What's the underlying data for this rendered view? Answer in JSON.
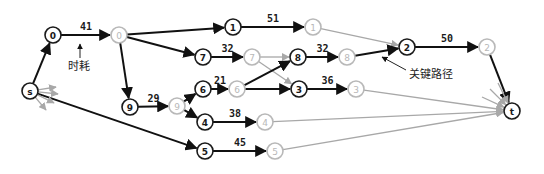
{
  "diagram": {
    "type": "critical-path-network",
    "annotations": {
      "time_cost": "时耗",
      "critical_path": "关键路径"
    },
    "nodes": [
      {
        "id": "s",
        "label": "s",
        "x": 30,
        "y": 91,
        "style": "dark"
      },
      {
        "id": "0a",
        "label": "0",
        "x": 53,
        "y": 35,
        "style": "dark"
      },
      {
        "id": "0b",
        "label": "0",
        "x": 119,
        "y": 35,
        "style": "gray"
      },
      {
        "id": "1a",
        "label": "1",
        "x": 233,
        "y": 27,
        "style": "dark"
      },
      {
        "id": "1b",
        "label": "1",
        "x": 313,
        "y": 27,
        "style": "gray"
      },
      {
        "id": "2a",
        "label": "2",
        "x": 407,
        "y": 47,
        "style": "dark"
      },
      {
        "id": "2b",
        "label": "2",
        "x": 487,
        "y": 47,
        "style": "gray"
      },
      {
        "id": "7a",
        "label": "7",
        "x": 203,
        "y": 57,
        "style": "dark"
      },
      {
        "id": "7b",
        "label": "7",
        "x": 252,
        "y": 57,
        "style": "gray"
      },
      {
        "id": "8a",
        "label": "8",
        "x": 298,
        "y": 57,
        "style": "dark"
      },
      {
        "id": "8b",
        "label": "8",
        "x": 347,
        "y": 57,
        "style": "gray"
      },
      {
        "id": "9a",
        "label": "9",
        "x": 130,
        "y": 107,
        "style": "dark"
      },
      {
        "id": "9b",
        "label": "9",
        "x": 177,
        "y": 106,
        "style": "gray"
      },
      {
        "id": "6a",
        "label": "6",
        "x": 203,
        "y": 89,
        "style": "dark"
      },
      {
        "id": "6b",
        "label": "6",
        "x": 237,
        "y": 89,
        "style": "gray"
      },
      {
        "id": "3a",
        "label": "3",
        "x": 299,
        "y": 89,
        "style": "dark"
      },
      {
        "id": "3b",
        "label": "3",
        "x": 356,
        "y": 89,
        "style": "gray"
      },
      {
        "id": "4a",
        "label": "4",
        "x": 205,
        "y": 122,
        "style": "dark"
      },
      {
        "id": "4b",
        "label": "4",
        "x": 265,
        "y": 122,
        "style": "gray"
      },
      {
        "id": "5a",
        "label": "5",
        "x": 205,
        "y": 151,
        "style": "dark"
      },
      {
        "id": "5b",
        "label": "5",
        "x": 275,
        "y": 151,
        "style": "gray"
      },
      {
        "id": "t",
        "label": "t",
        "x": 512,
        "y": 111,
        "style": "dark"
      }
    ],
    "edges": [
      {
        "from": "s",
        "to": "0a",
        "style": "dark"
      },
      {
        "from": "0a",
        "to": "0b",
        "style": "dark",
        "weight": "41"
      },
      {
        "from": "0b",
        "to": "1a",
        "style": "dark"
      },
      {
        "from": "0b",
        "to": "7a",
        "style": "dark"
      },
      {
        "from": "0b",
        "to": "9a",
        "style": "dark"
      },
      {
        "from": "1a",
        "to": "1b",
        "style": "dark",
        "weight": "51"
      },
      {
        "from": "1b",
        "to": "2a",
        "style": "gray"
      },
      {
        "from": "7a",
        "to": "7b",
        "style": "dark",
        "weight": "32"
      },
      {
        "from": "7b",
        "to": "8a",
        "style": "gray"
      },
      {
        "from": "7b",
        "to": "3a",
        "style": "gray"
      },
      {
        "from": "8a",
        "to": "8b",
        "style": "dark",
        "weight": "32"
      },
      {
        "from": "8b",
        "to": "2a",
        "style": "dark"
      },
      {
        "from": "2a",
        "to": "2b",
        "style": "dark",
        "weight": "50"
      },
      {
        "from": "2b",
        "to": "t",
        "style": "dark"
      },
      {
        "from": "9a",
        "to": "9b",
        "style": "dark",
        "weight": "29"
      },
      {
        "from": "9b",
        "to": "6a",
        "style": "dark"
      },
      {
        "from": "9b",
        "to": "4a",
        "style": "dark"
      },
      {
        "from": "6a",
        "to": "6b",
        "style": "dark",
        "weight": "21"
      },
      {
        "from": "6b",
        "to": "8a",
        "style": "dark"
      },
      {
        "from": "6b",
        "to": "3a",
        "style": "dark"
      },
      {
        "from": "3a",
        "to": "3b",
        "style": "dark",
        "weight": "36"
      },
      {
        "from": "3b",
        "to": "t",
        "style": "gray"
      },
      {
        "from": "4a",
        "to": "4b",
        "style": "dark",
        "weight": "38"
      },
      {
        "from": "4b",
        "to": "t",
        "style": "gray"
      },
      {
        "from": "s",
        "to": "5a",
        "style": "dark"
      },
      {
        "from": "5a",
        "to": "5b",
        "style": "dark",
        "weight": "45"
      },
      {
        "from": "5b",
        "to": "t",
        "style": "gray"
      }
    ],
    "stub_arrows": {
      "from_s": [
        [
          -28,
          -3
        ],
        [
          -24,
          -12
        ],
        [
          -26,
          4
        ],
        [
          -16,
          -19
        ]
      ],
      "into_t": [
        [
          -14,
          -28
        ],
        [
          -22,
          -22
        ],
        [
          -30,
          -14
        ]
      ]
    }
  }
}
